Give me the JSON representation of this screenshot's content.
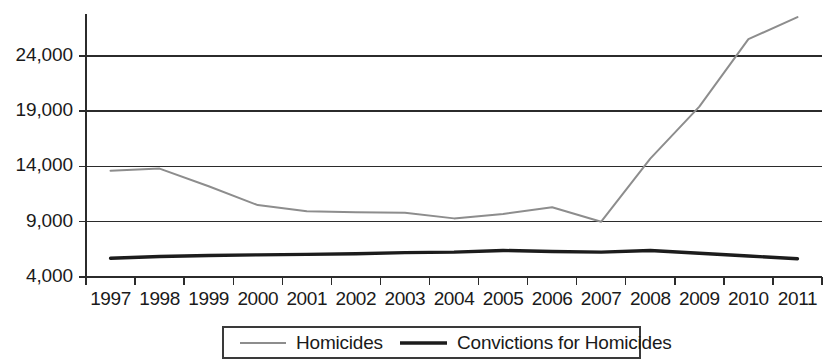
{
  "chart_data": {
    "type": "line",
    "title": "",
    "subtitle": "",
    "xlabel": "",
    "ylabel": "",
    "grid": true,
    "legend_position": "bottom",
    "categories": [
      "1997",
      "1998",
      "1999",
      "2000",
      "2001",
      "2002",
      "2003",
      "2004",
      "2005",
      "2006",
      "2007",
      "2008",
      "2009",
      "2010",
      "2011"
    ],
    "y_ticks": [
      "4,000",
      "9,000",
      "14,000",
      "19,000",
      "24,000"
    ],
    "y_tick_values": [
      4000,
      9000,
      14000,
      19000,
      24000
    ],
    "ylim": [
      4000,
      28500
    ],
    "series": [
      {
        "name": "Homicides",
        "color": "#8d8d8d",
        "values": [
          13600,
          13800,
          12200,
          10500,
          9950,
          9850,
          9800,
          9300,
          9700,
          10300,
          9000,
          14700,
          19400,
          25500,
          27500
        ]
      },
      {
        "name": "Convictions for Homicides",
        "color": "#1c1c1c",
        "values": [
          5700,
          5850,
          5950,
          6000,
          6050,
          6100,
          6200,
          6250,
          6400,
          6300,
          6250,
          6400,
          6150,
          5900,
          5650
        ]
      }
    ]
  },
  "legend": {
    "items": [
      {
        "label": "Homicides",
        "style": "thin-gray"
      },
      {
        "label": "Convictions for Homicides",
        "style": "thick-black"
      }
    ]
  },
  "colors": {
    "homicides": "#8d8d8d",
    "convictions": "#1c1c1c",
    "axis": "#2b2b2b",
    "text": "#1a1a1a",
    "background": "#ffffff"
  }
}
